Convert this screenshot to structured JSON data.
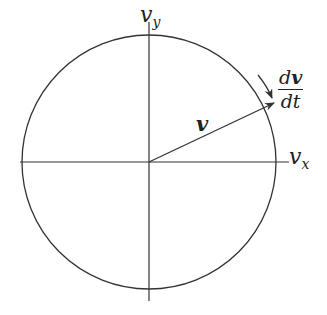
{
  "diagram": {
    "title": "",
    "axes": {
      "x_label": "v",
      "x_subscript": "x",
      "y_label": "v",
      "y_subscript": "y"
    },
    "vector_label": "v",
    "derivative_label": {
      "numerator_d": "d",
      "numerator_var": "v",
      "denominator": "dt"
    },
    "colors": {
      "stroke": "#333333",
      "background": "#ffffff"
    }
  }
}
